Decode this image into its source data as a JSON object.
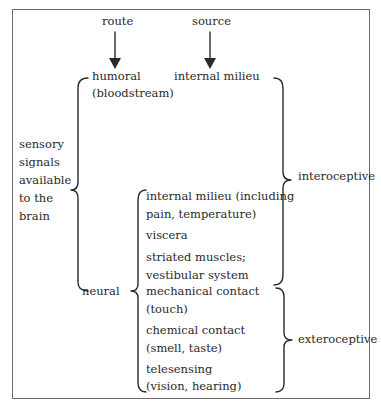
{
  "header": {
    "route_label": "route",
    "source_label": "source"
  },
  "left": {
    "lines": [
      "sensory",
      "signals",
      "available",
      "to the",
      "brain"
    ]
  },
  "routes": {
    "humoral": {
      "label": "humoral",
      "sublabel": "(bloodstream)"
    },
    "neural": {
      "label": "neural"
    }
  },
  "sources": {
    "humoral_source": "internal milieu",
    "neural_items": [
      {
        "line1": "internal milieu (including",
        "line2": "pain, temperature)"
      },
      {
        "line1": "viscera"
      },
      {
        "line1": "striated muscles;",
        "line2": "vestibular system"
      },
      {
        "line1": "mechanical contact",
        "line2": "(touch)"
      },
      {
        "line1": "chemical contact",
        "line2": "(smell, taste)"
      },
      {
        "line1": "telesensing",
        "line2": "(vision, hearing)"
      }
    ]
  },
  "categories": {
    "interoceptive": "interoceptive",
    "exteroceptive": "exteroceptive"
  },
  "colors": {
    "ink": "#2a2a2a",
    "frame": "#6d6d6d",
    "background": "#ffffff"
  }
}
